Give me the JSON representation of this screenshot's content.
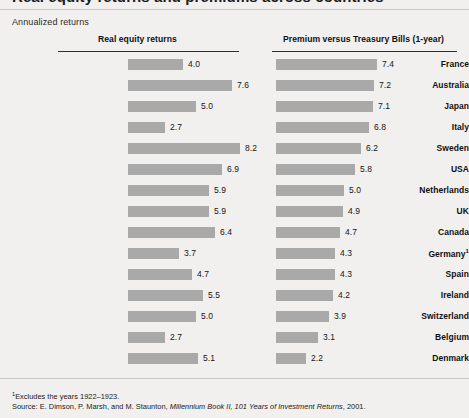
{
  "figure": {
    "title": "Real equity returns and premiums across countries",
    "subtitle": "Annualized returns",
    "background_color": "#f1f0ee",
    "bar_color": "#a9a9a9"
  },
  "columns": {
    "left_header": "Real equity returns",
    "right_header": "Premium versus Treasury Bills (1-year)"
  },
  "notes": {
    "footnote_marker": "1",
    "footnote_text": "Excludes the years 1922–1923.",
    "source_label": "Source: ",
    "source_authors": "E. Dimson, P. Marsh, and M. Staunton, ",
    "source_title": "Millennium Book II, 101 Years of Investment Returns",
    "source_year": ", 2001."
  },
  "chart_data": {
    "type": "bar",
    "title": "Annualized returns",
    "xlabel": "",
    "ylabel": "",
    "grid": false,
    "orientation": "horizontal",
    "categories": [
      "France",
      "Australia",
      "Japan",
      "Italy",
      "Sweden",
      "USA",
      "Netherlands",
      "UK",
      "Canada",
      "Germany",
      "Spain",
      "Ireland",
      "Switzerland",
      "Belgium",
      "Denmark"
    ],
    "category_footnotes": {
      "Germany": "1"
    },
    "series": [
      {
        "name": "Real equity returns",
        "values": [
          4.0,
          7.6,
          5.0,
          2.7,
          8.2,
          6.9,
          5.9,
          5.9,
          6.4,
          3.7,
          4.7,
          5.5,
          5.0,
          2.7,
          5.1
        ]
      },
      {
        "name": "Premium versus Treasury Bills (1-year)",
        "values": [
          7.4,
          7.2,
          7.1,
          6.8,
          6.2,
          5.8,
          5.0,
          4.9,
          4.7,
          4.3,
          4.3,
          4.2,
          3.9,
          3.1,
          2.2
        ]
      }
    ],
    "value_labels": {
      "left": [
        "4.0",
        "7.6",
        "5.0",
        "2.7",
        "8.2",
        "6.9",
        "5.9",
        "5.9",
        "6.4",
        "3.7",
        "4.7",
        "5.5",
        "5.0",
        "2.7",
        "5.1"
      ],
      "right": [
        "7.4",
        "7.2",
        "7.1",
        "6.8",
        "6.2",
        "5.8",
        "5.0",
        "4.9",
        "4.7",
        "4.3",
        "4.3",
        "4.2",
        "3.9",
        "3.1",
        "2.2"
      ]
    },
    "xlim": [
      0,
      8.2
    ],
    "units": "percent per year"
  }
}
